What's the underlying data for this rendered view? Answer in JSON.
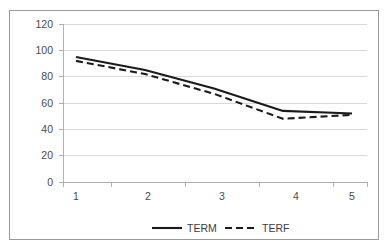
{
  "chart_data": {
    "type": "line",
    "title": "",
    "xlabel": "",
    "ylabel": "",
    "x": [
      1,
      2,
      3,
      4,
      5
    ],
    "categories": [
      "1",
      "2",
      "3",
      "4",
      "5"
    ],
    "series": [
      {
        "name": "TERM",
        "style": "solid",
        "values": [
          95,
          85,
          71,
          54,
          52
        ]
      },
      {
        "name": "TERF",
        "style": "dashed",
        "values": [
          92,
          82,
          67,
          48,
          51
        ]
      }
    ],
    "ylim": [
      0,
      120
    ],
    "ytick_step": 20,
    "ytick_labels": [
      "120",
      "100",
      "80",
      "60",
      "40",
      "20",
      "0"
    ],
    "xtick_labels": [
      "1",
      "2",
      "3",
      "4",
      "5"
    ],
    "grid": "horizontal",
    "legend_position": "bottom",
    "colors": {
      "series_line": "#1a1a1a",
      "gridline": "#d9d9d9",
      "axis": "#b0b0b0",
      "border": "#9a9a9a",
      "background": "#ffffff",
      "text": "#4a4a4a"
    }
  },
  "axis": {
    "y_labels": {
      "l0": "120",
      "l1": "100",
      "l2": "80",
      "l3": "60",
      "l4": "40",
      "l5": "20",
      "l6": "0"
    },
    "x_labels": {
      "t1": "1",
      "t2": "2",
      "t3": "3",
      "t4": "4",
      "t5": "5"
    }
  },
  "legend": {
    "entries": [
      {
        "label": "TERM",
        "style": "solid"
      },
      {
        "label": "TERF",
        "style": "dashed"
      }
    ],
    "item0_label": "TERM",
    "item1_label": "TERF"
  }
}
